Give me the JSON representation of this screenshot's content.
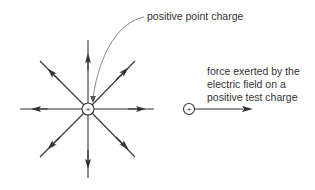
{
  "labels": {
    "point_charge": "positive point charge",
    "force_line1": "force exerted by the",
    "force_line2": "electric field on a",
    "force_line3": "positive test charge"
  },
  "symbols": {
    "source_charge": "+",
    "test_charge": "+"
  },
  "colors": {
    "line": "#333333",
    "text": "#333333",
    "leader": "#888888"
  }
}
